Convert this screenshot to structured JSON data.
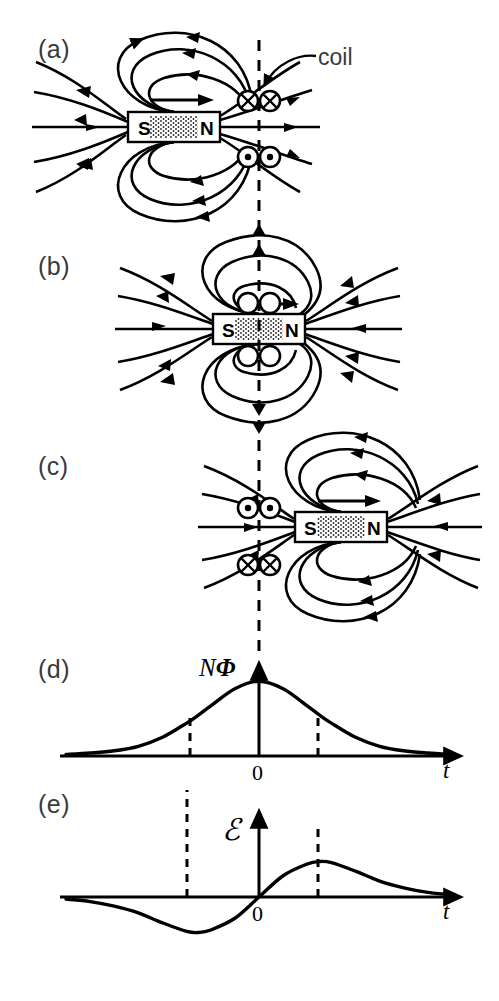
{
  "figure": {
    "ink_color": "#000000",
    "label_color": "#3a3a3a",
    "background": "#ffffff"
  },
  "panels": [
    {
      "id": "a",
      "label": "(a)",
      "label_x": 38,
      "label_y": 35,
      "description": "Magnet approaching coil from left",
      "magnet": {
        "south_label": "S",
        "north_label": "N",
        "x": 128,
        "y": 112,
        "w": 92,
        "h": 30,
        "velocity_arrow": "right"
      },
      "coil_markers": [
        {
          "symbol": "cross",
          "name": "current-into-page",
          "x": 248,
          "y": 101
        },
        {
          "symbol": "cross",
          "name": "current-into-page",
          "x": 270,
          "y": 101
        },
        {
          "symbol": "dot",
          "name": "current-out-of-page",
          "x": 248,
          "y": 157
        },
        {
          "symbol": "dot",
          "name": "current-out-of-page",
          "x": 270,
          "y": 157
        }
      ],
      "annotation": {
        "text": "coil",
        "x": 318,
        "y": 44
      }
    },
    {
      "id": "b",
      "label": "(b)",
      "label_x": 38,
      "label_y": 252,
      "description": "Magnet centered in coil, no induced current",
      "magnet": {
        "south_label": "S",
        "north_label": "N",
        "x": 213,
        "y": 314,
        "w": 92,
        "h": 30,
        "velocity_arrow": "right"
      },
      "coil_markers": [
        {
          "symbol": "empty",
          "name": "no-current-marker",
          "x": 248,
          "y": 303
        },
        {
          "symbol": "empty",
          "name": "no-current-marker",
          "x": 270,
          "y": 303
        },
        {
          "symbol": "empty",
          "name": "no-current-marker",
          "x": 248,
          "y": 356
        },
        {
          "symbol": "empty",
          "name": "no-current-marker",
          "x": 270,
          "y": 356
        }
      ]
    },
    {
      "id": "c",
      "label": "(c)",
      "label_x": 38,
      "label_y": 452,
      "description": "Magnet leaving coil to the right, current reversed",
      "magnet": {
        "south_label": "S",
        "north_label": "N",
        "x": 295,
        "y": 512,
        "w": 92,
        "h": 30,
        "velocity_arrow": "right"
      },
      "coil_markers": [
        {
          "symbol": "dot",
          "name": "current-out-of-page",
          "x": 248,
          "y": 508
        },
        {
          "symbol": "dot",
          "name": "current-out-of-page",
          "x": 270,
          "y": 508
        },
        {
          "symbol": "cross",
          "name": "current-into-page",
          "x": 248,
          "y": 565
        },
        {
          "symbol": "cross",
          "name": "current-into-page",
          "x": 270,
          "y": 565
        }
      ]
    },
    {
      "id": "d",
      "label": "(d)",
      "label_x": 38,
      "label_y": 655,
      "description": "Flux linkage versus time"
    },
    {
      "id": "e",
      "label": "(e)",
      "label_x": 38,
      "label_y": 790,
      "description": "Induced emf versus time"
    }
  ],
  "guide_line": {
    "name": "coil-plane-dashed-line",
    "x": 259,
    "y_top": 40,
    "y_bottom": 660,
    "style": "dashed"
  },
  "chart_data": [
    {
      "id": "d",
      "type": "line",
      "title": "",
      "ylabel": "NΦ",
      "ylabel_parts": {
        "n": "N",
        "phi": "Φ"
      },
      "xlabel": "t",
      "origin_label": "0",
      "xlim": [
        -3.2,
        3.2
      ],
      "ylim": [
        0,
        1.15
      ],
      "grid": false,
      "legend": false,
      "curve_description": "Gaussian bell curve peaking at t = 0",
      "markers": {
        "dashed_verticals": [
          -1.0,
          1.0
        ]
      },
      "x": [
        -3.2,
        -2.8,
        -2.4,
        -2.0,
        -1.6,
        -1.2,
        -1.0,
        -0.8,
        -0.4,
        0.0,
        0.4,
        0.8,
        1.0,
        1.2,
        1.6,
        2.0,
        2.4,
        2.8,
        3.2
      ],
      "y": [
        0.02,
        0.04,
        0.07,
        0.13,
        0.25,
        0.44,
        0.55,
        0.67,
        0.9,
        1.0,
        0.9,
        0.67,
        0.55,
        0.44,
        0.25,
        0.13,
        0.07,
        0.04,
        0.02
      ]
    },
    {
      "id": "e",
      "type": "line",
      "title": "",
      "ylabel": "ℰ",
      "xlabel": "t",
      "origin_label": "0",
      "xlim": [
        -3.2,
        3.2
      ],
      "ylim": [
        -1.1,
        1.1
      ],
      "grid": false,
      "legend": false,
      "curve_description": "Negative derivative of the flux curve: trough before t = 0, crest after t = 0, zero at t = 0",
      "markers": {
        "dashed_verticals": [
          -1.0,
          1.0
        ]
      },
      "x": [
        -3.2,
        -2.8,
        -2.4,
        -2.0,
        -1.6,
        -1.2,
        -1.0,
        -0.8,
        -0.4,
        0.0,
        0.4,
        0.8,
        1.0,
        1.2,
        1.6,
        2.0,
        2.4,
        2.8,
        3.2
      ],
      "y": [
        -0.06,
        -0.13,
        -0.26,
        -0.45,
        -0.73,
        -0.97,
        -1.0,
        -0.93,
        -0.6,
        0.0,
        0.6,
        0.93,
        1.0,
        0.97,
        0.73,
        0.45,
        0.26,
        0.13,
        0.06
      ]
    }
  ]
}
